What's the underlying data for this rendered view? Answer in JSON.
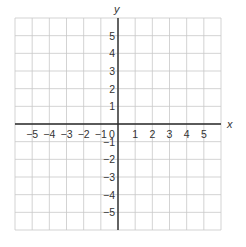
{
  "diagram": {
    "type": "coordinate-grid",
    "x_axis_label": "x",
    "y_axis_label": "y",
    "x_range": [
      -6,
      6
    ],
    "y_range": [
      -6,
      6
    ],
    "x_tick_labels": [
      "−5",
      "−4",
      "−3",
      "−2",
      "−1",
      "0",
      "1",
      "2",
      "3",
      "4",
      "5"
    ],
    "x_tick_values": [
      -5,
      -4,
      -3,
      -2,
      -1,
      0,
      1,
      2,
      3,
      4,
      5
    ],
    "y_tick_labels_positive": [
      "5",
      "4",
      "3",
      "2",
      "1"
    ],
    "y_tick_values_positive": [
      5,
      4,
      3,
      2,
      1
    ],
    "y_tick_labels_negative": [
      "−1",
      "−2",
      "−3",
      "−4",
      "−5"
    ],
    "y_tick_values_negative": [
      -1,
      -2,
      -3,
      -4,
      -5
    ],
    "colors": {
      "grid": "#c8c8c8",
      "axis": "#2a2a2a",
      "text": "#333333",
      "background": "#ffffff"
    }
  }
}
